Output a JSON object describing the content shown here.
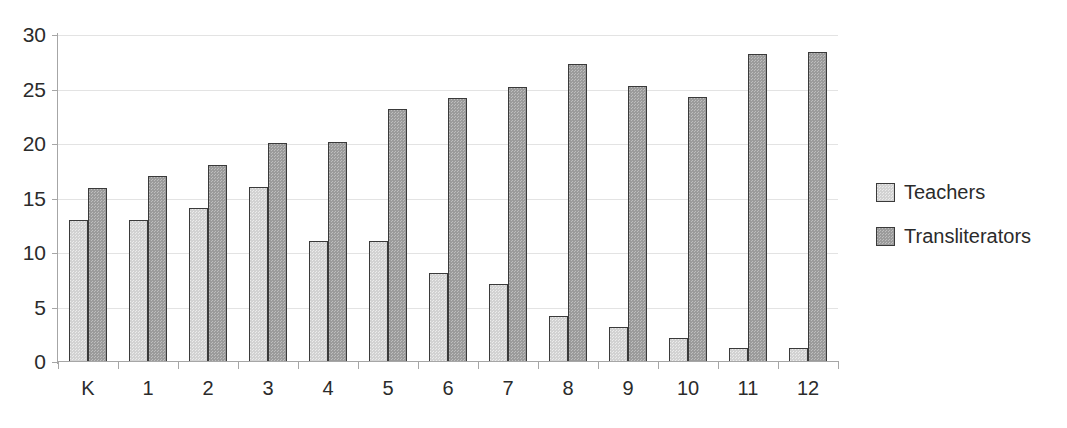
{
  "chart_data": {
    "type": "bar",
    "title": "",
    "subtitle": "",
    "xlabel": "",
    "ylabel": "",
    "grid": true,
    "legend_position": "right",
    "categories": [
      "K",
      "1",
      "2",
      "3",
      "4",
      "5",
      "6",
      "7",
      "8",
      "9",
      "10",
      "11",
      "12"
    ],
    "ytick_labels": [
      "0",
      "5",
      "10",
      "15",
      "20",
      "25",
      "30"
    ],
    "ytick_values": [
      0,
      5,
      10,
      15,
      20,
      25,
      30
    ],
    "ylim": [
      0,
      30
    ],
    "series": [
      {
        "name": "Teachers",
        "color": "#d2d2d2",
        "values": [
          13.0,
          13.0,
          14.1,
          16.1,
          11.1,
          11.1,
          8.2,
          7.2,
          4.2,
          3.2,
          2.2,
          1.3,
          1.3
        ]
      },
      {
        "name": "Transliterators",
        "color": "#9b9b9b",
        "values": [
          16.0,
          17.1,
          18.1,
          20.1,
          20.2,
          23.2,
          24.2,
          25.2,
          27.3,
          25.3,
          24.3,
          28.3,
          28.4
        ]
      }
    ]
  },
  "legend": {
    "items": [
      {
        "label": "Teachers",
        "swatch": "legend-swatch-teachers"
      },
      {
        "label": "Transliterators",
        "swatch": "legend-swatch-transliterators"
      }
    ]
  }
}
